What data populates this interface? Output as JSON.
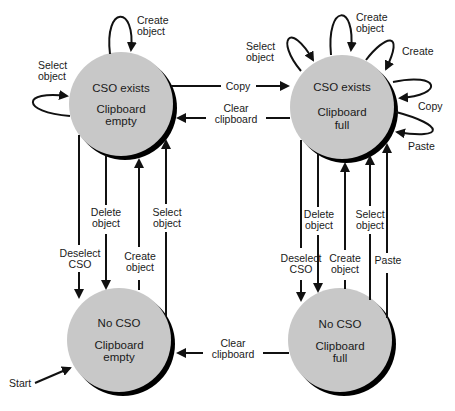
{
  "diagram": {
    "type": "state-transition",
    "states": [
      {
        "id": "cso_empty",
        "line1": "CSO exists",
        "line2": "Clipboard",
        "line3": "empty"
      },
      {
        "id": "cso_full",
        "line1": "CSO exists",
        "line2": "Clipboard",
        "line3": "full"
      },
      {
        "id": "nocso_empty",
        "line1": "No CSO",
        "line2": "Clipboard",
        "line3": "empty"
      },
      {
        "id": "nocso_full",
        "line1": "No CSO",
        "line2": "Clipboard",
        "line3": "full"
      }
    ],
    "labels": {
      "tl_create_1": "Create",
      "tl_create_2": "object",
      "tl_select_1": "Select",
      "tl_select_2": "object",
      "copy": "Copy",
      "clear_top_1": "Clear",
      "clear_top_2": "clipboard",
      "tr_select_1": "Select",
      "tr_select_2": "object",
      "tr_create_obj_1": "Create",
      "tr_create_obj_2": "object",
      "tr_create": "Create",
      "tr_copy": "Copy",
      "tr_paste": "Paste",
      "l_delete_1": "Delete",
      "l_delete_2": "object",
      "l_select_1": "Select",
      "l_select_2": "object",
      "l_deselect_1": "Deselect",
      "l_deselect_2": "CSO",
      "l_create_1": "Create",
      "l_create_2": "object",
      "r_delete_1": "Delete",
      "r_delete_2": "object",
      "r_select_1": "Select",
      "r_select_2": "object",
      "r_deselect_1": "Deselect",
      "r_deselect_2": "CSO",
      "r_create_1": "Create",
      "r_create_2": "object",
      "r_paste": "Paste",
      "clear_bottom_1": "Clear",
      "clear_bottom_2": "clipboard",
      "start": "Start"
    },
    "transitions": [
      {
        "from": "cso_empty",
        "to": "cso_empty",
        "label": "Create object"
      },
      {
        "from": "cso_empty",
        "to": "cso_empty",
        "label": "Select object"
      },
      {
        "from": "cso_empty",
        "to": "cso_full",
        "label": "Copy"
      },
      {
        "from": "cso_full",
        "to": "cso_empty",
        "label": "Clear clipboard"
      },
      {
        "from": "cso_full",
        "to": "cso_full",
        "label": "Select object"
      },
      {
        "from": "cso_full",
        "to": "cso_full",
        "label": "Create object"
      },
      {
        "from": "cso_full",
        "to": "cso_full",
        "label": "Create"
      },
      {
        "from": "cso_full",
        "to": "cso_full",
        "label": "Copy"
      },
      {
        "from": "cso_full",
        "to": "cso_full",
        "label": "Paste"
      },
      {
        "from": "cso_empty",
        "to": "nocso_empty",
        "label": "Deselect CSO"
      },
      {
        "from": "cso_empty",
        "to": "nocso_empty",
        "label": "Delete object"
      },
      {
        "from": "nocso_empty",
        "to": "cso_empty",
        "label": "Create object"
      },
      {
        "from": "nocso_empty",
        "to": "cso_empty",
        "label": "Select object"
      },
      {
        "from": "cso_full",
        "to": "nocso_full",
        "label": "Deselect CSO"
      },
      {
        "from": "cso_full",
        "to": "nocso_full",
        "label": "Delete object"
      },
      {
        "from": "nocso_full",
        "to": "cso_full",
        "label": "Create object"
      },
      {
        "from": "nocso_full",
        "to": "cso_full",
        "label": "Select object"
      },
      {
        "from": "nocso_full",
        "to": "cso_full",
        "label": "Paste"
      },
      {
        "from": "nocso_full",
        "to": "nocso_empty",
        "label": "Clear clipboard"
      },
      {
        "from": "start",
        "to": "nocso_empty",
        "label": "Start"
      }
    ],
    "colors": {
      "state_fill": "#c8c8c8",
      "shadow": "#000000",
      "line": "#111111"
    }
  }
}
